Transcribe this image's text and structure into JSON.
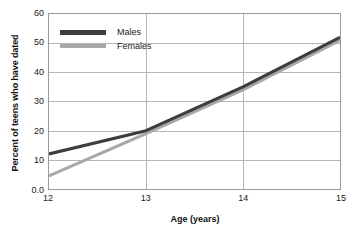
{
  "chart_data": {
    "type": "line",
    "title": "",
    "xlabel": "Age (years)",
    "ylabel": "Percent of teens who have dated",
    "x": [
      12,
      13,
      14,
      15
    ],
    "xticklabels": [
      "12",
      "13",
      "14",
      "15"
    ],
    "yticklabels": [
      "0.0",
      "10",
      "20",
      "30",
      "40",
      "50",
      "60"
    ],
    "yticks": [
      0,
      10,
      20,
      30,
      40,
      50,
      60
    ],
    "xlim": [
      12,
      15
    ],
    "ylim": [
      0,
      60
    ],
    "grid": true,
    "legend_position": "upper-left-inside",
    "series": [
      {
        "name": "Males",
        "color": "#3d3d3d",
        "values": [
          12,
          20,
          35,
          52
        ]
      },
      {
        "name": "Females",
        "color": "#a8a8a8",
        "values": [
          4.5,
          19,
          34,
          51
        ]
      }
    ]
  },
  "axes": {
    "x_title": "Age (years)",
    "y_title": "Percent of teens who have dated"
  },
  "legend": {
    "items": [
      {
        "label": "Males"
      },
      {
        "label": "Females"
      }
    ]
  },
  "ticks": {
    "y": [
      "60",
      "50",
      "40",
      "30",
      "20",
      "10",
      "0.0"
    ],
    "x": [
      "12",
      "13",
      "14",
      "15"
    ]
  },
  "colors": {
    "males": "#3d3d3d",
    "females": "#a8a8a8",
    "grid": "#b5b5b5",
    "frame": "#9a9a9a",
    "text": "#1a1a1a"
  }
}
